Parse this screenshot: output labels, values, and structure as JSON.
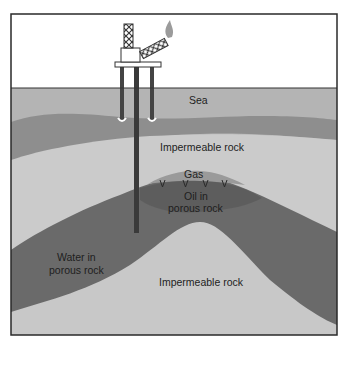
{
  "diagram": {
    "type": "geological cross-section",
    "labels": {
      "sea": "Sea",
      "impermeable_rock_top": "Impermeable rock",
      "gas": "Gas",
      "oil_line1": "Oil in",
      "oil_line2": "porous rock",
      "water_line1": "Water in",
      "water_line2": "porous rock",
      "impermeable_rock_bottom": "Impermeable rock"
    },
    "elements": {
      "platform": "drilling-platform",
      "derrick": "derrick-tower",
      "flare": "gas-flare",
      "well_pipe": "well-pipe",
      "legs": "platform-legs"
    },
    "colors": {
      "sky": "#ffffff",
      "sea": "#b4b4b4",
      "seabed": "#8e8e8e",
      "impermeable": "#cbcbcb",
      "gas": "#9a9a9a",
      "oil": "#5e5e5e",
      "water": "#6e6e6e",
      "border": "#2a2a2a",
      "flame": "#9b9b9b"
    }
  }
}
